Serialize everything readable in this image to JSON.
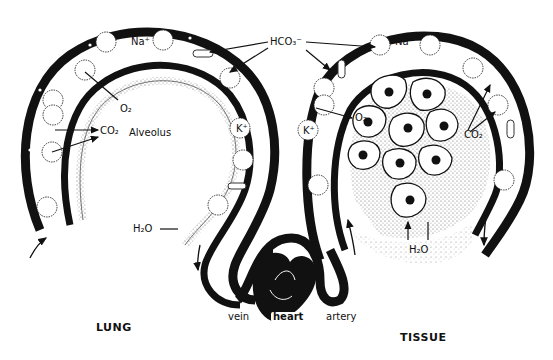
{
  "diagram": {
    "regions": {
      "left": "LUNG",
      "right": "TISSUE",
      "alveolus": "Alveolus",
      "heart": "heart",
      "vein": "vein",
      "artery": "artery"
    },
    "labels": {
      "hco3_top": "HCO₃⁻",
      "na_left": "Na⁺",
      "na_right": "Na⁺",
      "k_left": "K⁺",
      "k_right": "K⁺",
      "o2_lung": "O₂",
      "co2_lung": "CO₂",
      "h2o_lung": "H₂O",
      "o2_tissue": "O₂",
      "co2_tissue": "CO₂",
      "h2o_tissue": "H₂O"
    },
    "colors": {
      "ink": "#111111",
      "background": "#ffffff",
      "stipple": "#9a9a9a"
    }
  }
}
